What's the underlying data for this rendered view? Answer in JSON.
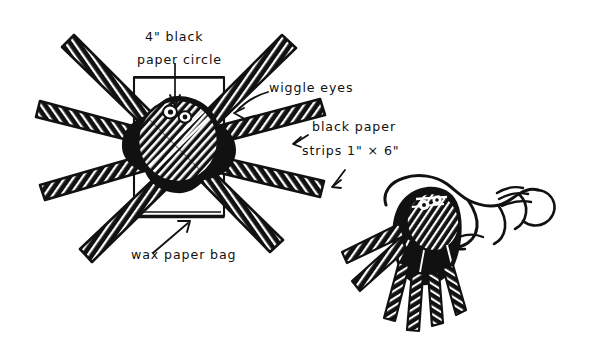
{
  "illustration": {
    "title": "Wax paper bag spider puppet craft diagram",
    "medium": "pen-and-ink line drawing",
    "background_color": "#ffffff",
    "ink_color": "#111111"
  },
  "labels": {
    "circle": {
      "line1": "4\" black",
      "line2": "paper circle",
      "pointer": "straight-arrow-down"
    },
    "eyes": {
      "line1": "wiggle eyes",
      "pointer": "curved-arrow-down-left"
    },
    "strips": {
      "line1": "black paper",
      "line2": "strips  1\" × 6\"",
      "pointer_upper": "small-arrow-up-left",
      "pointer_lower": "small-arrow-down-left"
    },
    "bag": {
      "line1": "wax paper bag",
      "pointer": "straight-arrow-up-right"
    }
  },
  "figures": {
    "main": {
      "name": "assembled-spider-on-bag",
      "parts": [
        "wax-paper-bag",
        "black-paper-circle",
        "paper-strip-legs",
        "wiggle-eyes"
      ],
      "leg_count": 8
    },
    "secondary": {
      "name": "hand-holding-puppet",
      "parts": [
        "hand",
        "wrist",
        "spider-body",
        "dangling-legs"
      ],
      "dangling_leg_count": 6
    }
  }
}
